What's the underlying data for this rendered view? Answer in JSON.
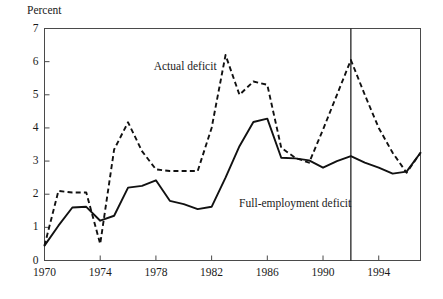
{
  "chart_data": {
    "type": "line",
    "title": "",
    "xlabel": "",
    "ylabel": "Percent",
    "xlim": [
      1970,
      1997
    ],
    "ylim": [
      0,
      7
    ],
    "grid": false,
    "legend_position": "inline-annotations",
    "y_ticks": [
      "0",
      "1",
      "2",
      "3",
      "4",
      "5",
      "6",
      "7"
    ],
    "x_ticks": [
      "1970",
      "1974",
      "1978",
      "1982",
      "1986",
      "1990",
      "1994"
    ],
    "x_tick_values": [
      1970,
      1974,
      1978,
      1982,
      1986,
      1990,
      1994
    ],
    "y_tick_values": [
      0,
      1,
      2,
      3,
      4,
      5,
      6,
      7
    ],
    "x": [
      1970,
      1971,
      1972,
      1973,
      1974,
      1975,
      1976,
      1977,
      1978,
      1979,
      1980,
      1981,
      1982,
      1983,
      1984,
      1985,
      1986,
      1987,
      1988,
      1989,
      1990,
      1991,
      1992,
      1993,
      1994,
      1995,
      1996,
      1997
    ],
    "series": [
      {
        "name": "Actual deficit",
        "style": "dashed",
        "values": [
          0.45,
          2.1,
          2.05,
          2.05,
          0.5,
          3.35,
          4.17,
          3.3,
          2.75,
          2.7,
          2.7,
          2.7,
          4.0,
          6.2,
          5.0,
          5.4,
          5.3,
          3.4,
          3.1,
          2.95,
          3.95,
          5.0,
          6.05,
          5.0,
          4.0,
          3.25,
          2.65,
          3.25
        ]
      },
      {
        "name": "Full-employment deficit",
        "style": "solid",
        "values": [
          0.45,
          1.05,
          1.6,
          1.62,
          1.2,
          1.35,
          2.2,
          2.25,
          2.42,
          1.8,
          1.7,
          1.55,
          1.62,
          2.5,
          3.45,
          4.18,
          4.28,
          3.1,
          3.08,
          3.02,
          2.8,
          3.0,
          3.15,
          2.95,
          2.8,
          2.62,
          2.68,
          3.25
        ]
      }
    ],
    "annotations": [
      {
        "text": "Actual deficit",
        "x": 1980.1,
        "y": 5.75,
        "anchor": "middle"
      },
      {
        "text": "Full-employment deficit",
        "x": 1988.0,
        "y": 1.6,
        "anchor": "middle"
      }
    ],
    "marker_lines": [
      {
        "name": "forecast-boundary",
        "x": 1992,
        "orientation": "vertical"
      }
    ]
  }
}
